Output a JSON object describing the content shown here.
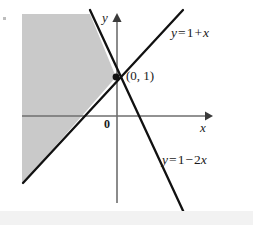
{
  "figure": {
    "caption_free": true,
    "width": 253,
    "height": 225,
    "background_color": "#ffffff",
    "labels": {
      "y_axis": "y",
      "x_axis": "x",
      "origin": "0",
      "intersection_point": "(0, 1)",
      "line_1_parts": {
        "lhs": "y",
        "eq": "=",
        "const": "1",
        "sign": "+",
        "var": "x"
      },
      "line_2_parts": {
        "lhs": "y",
        "eq": "=",
        "const": "1",
        "sign": "−",
        "coef": "2",
        "var": "x"
      },
      "line_1_text": "y = 1 + x",
      "line_2_text": "y = 1 − 2x"
    }
  },
  "colors": {
    "line": "#111111",
    "axis": "#6e6e6e",
    "shaded_region": "#c9c9c9",
    "text": "#1a1a1a",
    "bottom_band": "#f2f2f2"
  },
  "chart_data": {
    "type": "line",
    "title": "",
    "xlabel": "x",
    "ylabel": "y",
    "grid": false,
    "legend": "none",
    "axes": {
      "origin_px": [
        117,
        116
      ],
      "unit_px": 39,
      "xlim": [
        -2.45,
        2.4
      ],
      "ylim": [
        -1.75,
        2.6
      ],
      "x_arrow_tip_px": [
        210,
        116
      ],
      "y_arrow_tip_px": [
        117,
        14
      ]
    },
    "series": [
      {
        "name": "y = 1 + x",
        "equation": "y = 1 + x",
        "slope": 1,
        "intercept": 1,
        "style": "solid",
        "color": "#111111",
        "endpoints_px": [
          [
            23,
            183
          ],
          [
            183,
            10
          ]
        ],
        "endpoints_data": [
          [
            -2.41,
            -1.72
          ],
          [
            1.69,
            2.72
          ]
        ],
        "label": "y = 1 + x",
        "label_pos_px": [
          171,
          26
        ]
      },
      {
        "name": "y = 1 - 2x",
        "equation": "y = 1 − 2x",
        "slope": -2,
        "intercept": 1,
        "style": "solid",
        "color": "#111111",
        "endpoints_px": [
          [
            90,
            10
          ],
          [
            185,
            215
          ]
        ],
        "endpoints_data": [
          [
            -0.69,
            2.72
          ],
          [
            1.74,
            -2.54
          ]
        ],
        "label": "y = 1 − 2x",
        "label_pos_px": [
          162,
          153
        ]
      }
    ],
    "points": [
      {
        "label": "(0, 1)",
        "x": 0,
        "y": 1,
        "px": [
          116,
          77
        ],
        "marker": "filled-circle",
        "color": "#111111"
      }
    ],
    "shaded_regions": [
      {
        "description": "region left of both lines (y >= 1 + x and y <= 1 - 2x)",
        "fill": "#c9c9c9",
        "polygon_px": [
          [
            22,
            14
          ],
          [
            90,
            14
          ],
          [
            116,
            77
          ],
          [
            23,
            183
          ],
          [
            22,
            183
          ]
        ]
      }
    ]
  }
}
